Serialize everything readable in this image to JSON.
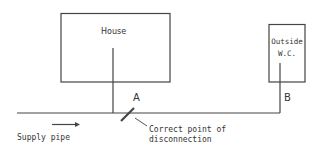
{
  "diagram": {
    "house_label": "House",
    "outside_wc_label_line1": "Outside",
    "outside_wc_label_line2": "W.C.",
    "point_a_label": "A",
    "point_b_label": "B",
    "supply_pipe_label": "Supply pipe",
    "callout_line1": "Correct point of",
    "callout_line2": "disconnection",
    "stroke_color": "#444444"
  }
}
